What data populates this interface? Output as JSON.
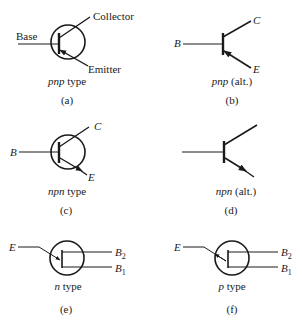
{
  "panels": [
    {
      "id": "a",
      "caption": "(a)",
      "type_italic": "pnp",
      "type_rest": " type",
      "labels": {
        "base": "Base",
        "collector": "Collector",
        "emitter": "Emitter"
      }
    },
    {
      "id": "b",
      "caption": "(b)",
      "type_italic": "pnp",
      "type_rest": " (alt.)",
      "labels": {
        "base": "B",
        "collector": "C",
        "emitter": "E"
      }
    },
    {
      "id": "c",
      "caption": "(c)",
      "type_italic": "npn",
      "type_rest": " type",
      "labels": {
        "base": "B",
        "collector": "C",
        "emitter": "E"
      }
    },
    {
      "id": "d",
      "caption": "(d)",
      "type_italic": "npn",
      "type_rest": " (alt.)",
      "labels": {}
    },
    {
      "id": "e",
      "caption": "(e)",
      "type_italic": "n",
      "type_rest": " type",
      "labels": {
        "emitter": "E",
        "b2": "B",
        "b2_sub": "2",
        "b1": "B",
        "b1_sub": "1"
      }
    },
    {
      "id": "f",
      "caption": "(f)",
      "type_italic": "p",
      "type_rest": " type",
      "labels": {
        "emitter": "E",
        "b2": "B",
        "b2_sub": "2",
        "b1": "B",
        "b1_sub": "1"
      }
    }
  ],
  "colors": {
    "ink": "#1a1a1a",
    "background": "#ffffff"
  }
}
